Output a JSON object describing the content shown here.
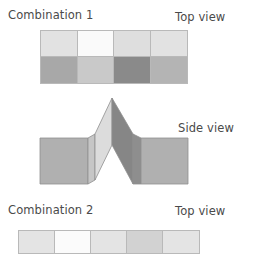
{
  "diagram": {
    "background": "#ffffff",
    "text_color": "#4a4a4a",
    "outline_color": "#b9b9b9"
  },
  "sections": [
    {
      "name": "combination-1",
      "label": "Combination 1",
      "view_label": "Top view",
      "view_type": "top",
      "grid": {
        "columns": 4,
        "rows": 2,
        "cells": [
          {
            "row": 1,
            "col": 1,
            "shade": "light-gray",
            "color": "#e2e2e2"
          },
          {
            "row": 1,
            "col": 2,
            "shade": "white",
            "color": "#fafafa"
          },
          {
            "row": 1,
            "col": 3,
            "shade": "light-gray",
            "color": "#dedede"
          },
          {
            "row": 1,
            "col": 4,
            "shade": "light-gray",
            "color": "#e2e2e2"
          },
          {
            "row": 2,
            "col": 1,
            "shade": "medium-gray",
            "color": "#a8a8a8"
          },
          {
            "row": 2,
            "col": 2,
            "shade": "pale-gray",
            "color": "#c9c9c9"
          },
          {
            "row": 2,
            "col": 3,
            "shade": "dark-gray",
            "color": "#8a8a8a"
          },
          {
            "row": 2,
            "col": 4,
            "shade": "medium-gray",
            "color": "#b4b4b4"
          }
        ]
      }
    },
    {
      "name": "combination-1-side",
      "view_label": "Side view",
      "view_type": "side",
      "shape": {
        "description": "two flat panels flanking a central peak",
        "apex_x": 112,
        "apex_y": 8,
        "left_panel_color": "#b0b0b0",
        "left_panel_edge_color": "#c6c6c6",
        "right_panel_color": "#b0b0b0",
        "right_panel_edge_color": "#8e8e8e",
        "peak_left_face_color": "#dcdcdc",
        "peak_right_face_color": "#868686",
        "outline_color": "#8f8f8f"
      }
    },
    {
      "name": "combination-2",
      "label": "Combination 2",
      "view_label": "Top view",
      "view_type": "top",
      "grid": {
        "columns": 5,
        "rows": 1,
        "cells": [
          {
            "row": 1,
            "col": 1,
            "shade": "light-gray",
            "color": "#e4e4e4"
          },
          {
            "row": 1,
            "col": 2,
            "shade": "white",
            "color": "#fbfbfb"
          },
          {
            "row": 1,
            "col": 3,
            "shade": "light-gray",
            "color": "#e4e4e4"
          },
          {
            "row": 1,
            "col": 4,
            "shade": "gray",
            "color": "#d2d2d2"
          },
          {
            "row": 1,
            "col": 5,
            "shade": "light-gray",
            "color": "#e4e4e4"
          }
        ]
      }
    }
  ]
}
